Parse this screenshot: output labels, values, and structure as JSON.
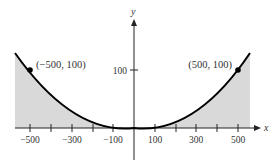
{
  "figure": {
    "type": "parabola-with-shaded-regions",
    "equation_shape": "y = x^2 / 2500",
    "x_axis_label": "x",
    "y_axis_label": "y",
    "x_ticks": [
      -500,
      -400,
      -300,
      -200,
      -100,
      100,
      200,
      300,
      400,
      500
    ],
    "x_tick_labels": [
      {
        "value": -500,
        "label": "−500"
      },
      {
        "value": -300,
        "label": "−300"
      },
      {
        "value": -100,
        "label": "−100"
      },
      {
        "value": 100,
        "label": "100"
      },
      {
        "value": 300,
        "label": "300"
      },
      {
        "value": 500,
        "label": "500"
      }
    ],
    "y_ticks": [
      {
        "value": 100,
        "label": "100"
      }
    ],
    "points": [
      {
        "x": -500,
        "y": 100,
        "label": "(−500, 100)"
      },
      {
        "x": 500,
        "y": 100,
        "label": "(500, 100)"
      }
    ],
    "shade_color": "#d9d9d9",
    "curve_color": "#000000"
  }
}
